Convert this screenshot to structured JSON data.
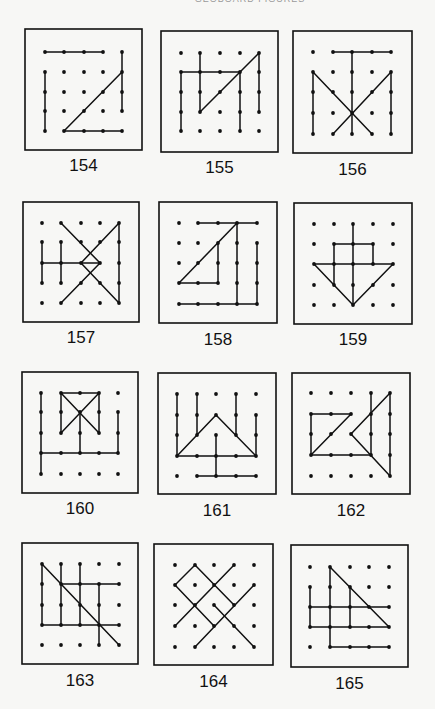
{
  "page": {
    "header": "GEOBOARD FIGURES",
    "ink": "#111111",
    "paper": "#f7f7f5"
  },
  "figures": [
    {
      "number": "154",
      "box": [
        25,
        29,
        142,
        150
      ],
      "xs": [
        45,
        64,
        84,
        103,
        122
      ],
      "ys": [
        52,
        72,
        92,
        111,
        131
      ],
      "label_y": 157,
      "segments": [
        [
          [
            0,
            0
          ],
          [
            3,
            0
          ]
        ],
        [
          [
            0,
            1
          ],
          [
            0,
            4
          ]
        ],
        [
          [
            4,
            0
          ],
          [
            4,
            3
          ]
        ],
        [
          [
            1,
            4
          ],
          [
            4,
            4
          ]
        ],
        [
          [
            1,
            4
          ],
          [
            4,
            1
          ]
        ]
      ]
    },
    {
      "number": "155",
      "box": [
        161,
        31,
        278,
        152
      ],
      "xs": [
        181,
        200,
        220,
        240,
        259
      ],
      "ys": [
        53,
        72,
        92,
        112,
        131
      ],
      "label_y": 159,
      "segments": [
        [
          [
            1,
            0
          ],
          [
            1,
            3
          ]
        ],
        [
          [
            0,
            1
          ],
          [
            3,
            1
          ]
        ],
        [
          [
            0,
            1
          ],
          [
            0,
            4
          ]
        ],
        [
          [
            1,
            3
          ],
          [
            4,
            0
          ]
        ],
        [
          [
            4,
            0
          ],
          [
            4,
            3
          ]
        ],
        [
          [
            3,
            1
          ],
          [
            3,
            4
          ]
        ]
      ]
    },
    {
      "number": "156",
      "box": [
        293,
        31,
        412,
        153
      ],
      "xs": [
        313,
        333,
        352,
        372,
        391
      ],
      "ys": [
        52,
        72,
        92,
        113,
        134
      ],
      "label_y": 161,
      "segments": [
        [
          [
            1,
            0
          ],
          [
            4,
            0
          ]
        ],
        [
          [
            2,
            0
          ],
          [
            2,
            4
          ]
        ],
        [
          [
            0,
            1
          ],
          [
            0,
            4
          ]
        ],
        [
          [
            4,
            1
          ],
          [
            4,
            4
          ]
        ],
        [
          [
            0,
            1
          ],
          [
            3,
            4
          ]
        ],
        [
          [
            4,
            1
          ],
          [
            1,
            4
          ]
        ]
      ]
    },
    {
      "number": "157",
      "box": [
        23,
        202,
        139,
        322
      ],
      "xs": [
        42,
        61,
        81,
        100,
        119
      ],
      "ys": [
        223,
        242,
        263,
        283,
        303
      ],
      "label_y": 329,
      "segments": [
        [
          [
            0,
            1
          ],
          [
            0,
            3
          ]
        ],
        [
          [
            1,
            1
          ],
          [
            1,
            3
          ]
        ],
        [
          [
            0,
            2
          ],
          [
            3,
            2
          ]
        ],
        [
          [
            1,
            0
          ],
          [
            3,
            2
          ]
        ],
        [
          [
            3,
            2
          ],
          [
            1,
            4
          ]
        ],
        [
          [
            4,
            0
          ],
          [
            2,
            2
          ]
        ],
        [
          [
            2,
            2
          ],
          [
            4,
            4
          ]
        ],
        [
          [
            4,
            0
          ],
          [
            4,
            4
          ]
        ]
      ]
    },
    {
      "number": "158",
      "box": [
        159,
        202,
        277,
        323
      ],
      "xs": [
        179,
        198,
        218,
        237,
        257
      ],
      "ys": [
        223,
        243,
        263,
        283,
        304
      ],
      "label_y": 331,
      "segments": [
        [
          [
            1,
            0
          ],
          [
            4,
            0
          ]
        ],
        [
          [
            0,
            3
          ],
          [
            3,
            0
          ]
        ],
        [
          [
            0,
            3
          ],
          [
            2,
            3
          ]
        ],
        [
          [
            2,
            1
          ],
          [
            2,
            3
          ]
        ],
        [
          [
            3,
            0
          ],
          [
            3,
            4
          ]
        ],
        [
          [
            4,
            1
          ],
          [
            4,
            4
          ]
        ],
        [
          [
            0,
            4
          ],
          [
            4,
            4
          ]
        ]
      ]
    },
    {
      "number": "159",
      "box": [
        294,
        203,
        412,
        324
      ],
      "xs": [
        314,
        334,
        353,
        373,
        393
      ],
      "ys": [
        224,
        244,
        264,
        285,
        305
      ],
      "label_y": 331,
      "segments": [
        [
          [
            2,
            0
          ],
          [
            2,
            4
          ]
        ],
        [
          [
            1,
            1
          ],
          [
            3,
            1
          ]
        ],
        [
          [
            1,
            1
          ],
          [
            1,
            3
          ]
        ],
        [
          [
            3,
            1
          ],
          [
            3,
            2
          ]
        ],
        [
          [
            0,
            2
          ],
          [
            4,
            2
          ]
        ],
        [
          [
            0,
            2
          ],
          [
            2,
            4
          ]
        ],
        [
          [
            2,
            4
          ],
          [
            4,
            2
          ]
        ]
      ]
    },
    {
      "number": "160",
      "box": [
        22,
        372,
        138,
        493
      ],
      "xs": [
        41,
        61,
        80,
        99,
        118
      ],
      "ys": [
        393,
        412,
        433,
        453,
        474
      ],
      "label_y": 500,
      "segments": [
        [
          [
            0,
            0
          ],
          [
            0,
            4
          ]
        ],
        [
          [
            1,
            0
          ],
          [
            3,
            0
          ]
        ],
        [
          [
            1,
            0
          ],
          [
            1,
            2
          ]
        ],
        [
          [
            3,
            0
          ],
          [
            3,
            2
          ]
        ],
        [
          [
            1,
            0
          ],
          [
            3,
            2
          ]
        ],
        [
          [
            3,
            0
          ],
          [
            1,
            2
          ]
        ],
        [
          [
            2,
            1
          ],
          [
            2,
            3
          ]
        ],
        [
          [
            0,
            3
          ],
          [
            4,
            3
          ]
        ],
        [
          [
            4,
            1
          ],
          [
            4,
            3
          ]
        ]
      ]
    },
    {
      "number": "161",
      "box": [
        158,
        373,
        276,
        494
      ],
      "xs": [
        177,
        197,
        216,
        236,
        256
      ],
      "ys": [
        394,
        415,
        435,
        456,
        476
      ],
      "label_y": 502,
      "segments": [
        [
          [
            0,
            0
          ],
          [
            0,
            3
          ]
        ],
        [
          [
            1,
            0
          ],
          [
            1,
            2
          ]
        ],
        [
          [
            3,
            0
          ],
          [
            3,
            2
          ]
        ],
        [
          [
            4,
            1
          ],
          [
            4,
            3
          ]
        ],
        [
          [
            0,
            3
          ],
          [
            2,
            1
          ]
        ],
        [
          [
            2,
            1
          ],
          [
            4,
            3
          ]
        ],
        [
          [
            0,
            3
          ],
          [
            4,
            3
          ]
        ],
        [
          [
            2,
            2
          ],
          [
            2,
            4
          ]
        ],
        [
          [
            1,
            4
          ],
          [
            4,
            4
          ]
        ]
      ]
    },
    {
      "number": "162",
      "box": [
        292,
        373,
        410,
        494
      ],
      "xs": [
        311,
        331,
        351,
        371,
        390
      ],
      "ys": [
        393,
        414,
        434,
        455,
        476
      ],
      "label_y": 502,
      "segments": [
        [
          [
            0,
            1
          ],
          [
            2,
            1
          ]
        ],
        [
          [
            0,
            1
          ],
          [
            0,
            3
          ]
        ],
        [
          [
            0,
            3
          ],
          [
            3,
            3
          ]
        ],
        [
          [
            0,
            3
          ],
          [
            2,
            1
          ]
        ],
        [
          [
            3,
            0
          ],
          [
            3,
            3
          ]
        ],
        [
          [
            4,
            0
          ],
          [
            2,
            2
          ]
        ],
        [
          [
            2,
            2
          ],
          [
            4,
            4
          ]
        ],
        [
          [
            4,
            0
          ],
          [
            4,
            4
          ]
        ]
      ]
    },
    {
      "number": "163",
      "box": [
        22,
        543,
        138,
        664
      ],
      "xs": [
        42,
        61,
        80,
        99,
        119
      ],
      "ys": [
        564,
        584,
        605,
        625,
        645
      ],
      "label_y": 672,
      "segments": [
        [
          [
            0,
            0
          ],
          [
            0,
            3
          ]
        ],
        [
          [
            1,
            0
          ],
          [
            1,
            3
          ]
        ],
        [
          [
            2,
            0
          ],
          [
            2,
            3
          ]
        ],
        [
          [
            3,
            1
          ],
          [
            3,
            4
          ]
        ],
        [
          [
            1,
            1
          ],
          [
            4,
            1
          ]
        ],
        [
          [
            0,
            3
          ],
          [
            4,
            3
          ]
        ],
        [
          [
            0,
            0
          ],
          [
            4,
            4
          ]
        ]
      ]
    },
    {
      "number": "164",
      "box": [
        154,
        544,
        273,
        665
      ],
      "xs": [
        175,
        195,
        214,
        234,
        254
      ],
      "ys": [
        565,
        585,
        605,
        626,
        647
      ],
      "label_y": 673,
      "segments": [
        [
          [
            0,
            1
          ],
          [
            1,
            0
          ]
        ],
        [
          [
            1,
            0
          ],
          [
            3,
            2
          ]
        ],
        [
          [
            0,
            1
          ],
          [
            2,
            3
          ]
        ],
        [
          [
            3,
            0
          ],
          [
            0,
            3
          ]
        ],
        [
          [
            4,
            1
          ],
          [
            1,
            4
          ]
        ],
        [
          [
            2,
            2
          ],
          [
            4,
            4
          ]
        ]
      ]
    },
    {
      "number": "165",
      "box": [
        291,
        545,
        408,
        667
      ],
      "xs": [
        310,
        330,
        350,
        369,
        389
      ],
      "ys": [
        567,
        587,
        607,
        627,
        647
      ],
      "label_y": 675,
      "segments": [
        [
          [
            1,
            0
          ],
          [
            1,
            4
          ]
        ],
        [
          [
            1,
            0
          ],
          [
            4,
            3
          ]
        ],
        [
          [
            0,
            1
          ],
          [
            0,
            3
          ]
        ],
        [
          [
            0,
            2
          ],
          [
            4,
            2
          ]
        ],
        [
          [
            0,
            3
          ],
          [
            4,
            3
          ]
        ],
        [
          [
            2,
            1
          ],
          [
            2,
            3
          ]
        ],
        [
          [
            1,
            4
          ],
          [
            4,
            4
          ]
        ]
      ]
    }
  ]
}
